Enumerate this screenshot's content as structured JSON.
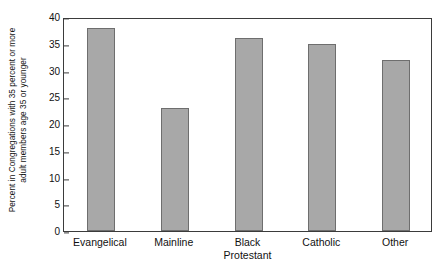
{
  "chart_data": {
    "type": "bar",
    "title": "",
    "xlabel": "",
    "ylabel": "Percent in Congregations with 35 percent or more adult members age 35 or younger",
    "ylabel_lines": [
      "Percent in Congregations with 35 percent or more",
      "adult members age 35 or younger"
    ],
    "categories": [
      "Evangelical",
      "Mainline",
      "Black Protestant",
      "Catholic",
      "Other"
    ],
    "category_lines": [
      [
        "Evangelical"
      ],
      [
        "Mainline"
      ],
      [
        "Black",
        "Protestant"
      ],
      [
        "Catholic"
      ],
      [
        "Other"
      ]
    ],
    "values": [
      38,
      23,
      36,
      35,
      32
    ],
    "ylim": [
      0,
      40
    ],
    "yticks": [
      0,
      5,
      10,
      15,
      20,
      25,
      30,
      35,
      40
    ],
    "ytick_labels": [
      "0",
      "5",
      "10",
      "15",
      "20",
      "25",
      "30",
      "35",
      "40"
    ],
    "grid": false,
    "legend": false,
    "bar_fill_color": "#a8a8a8",
    "bar_edge_color": "#6e6e6e",
    "axis_color": "#3b3b3b",
    "background_color": "#ffffff"
  }
}
